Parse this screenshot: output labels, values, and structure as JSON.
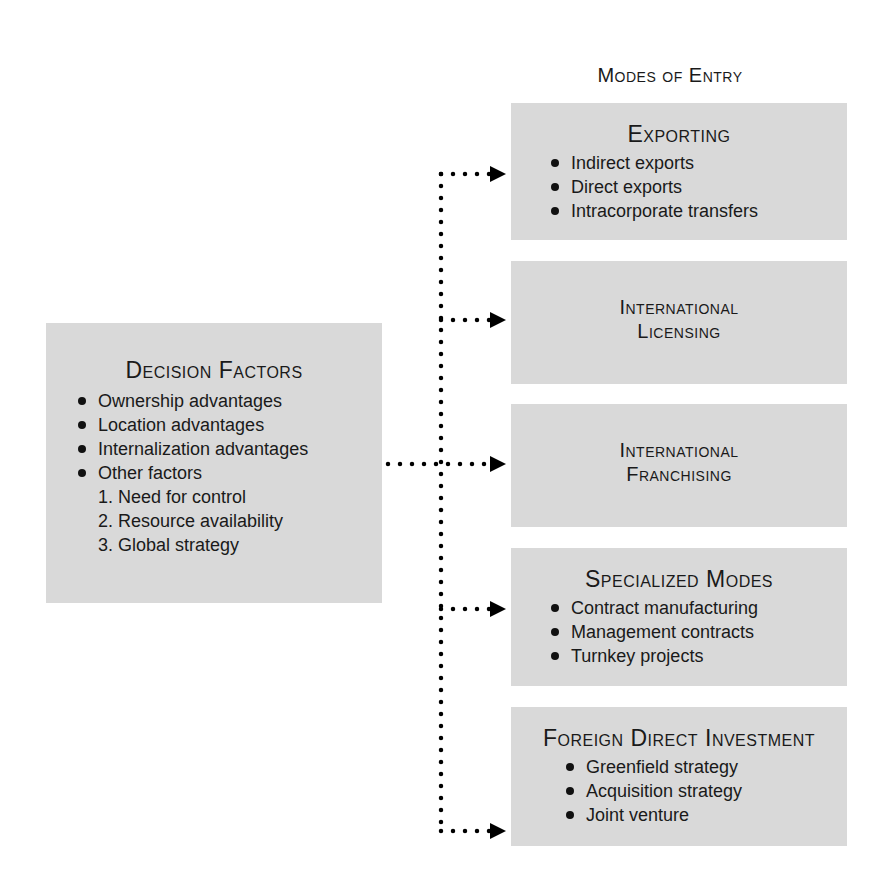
{
  "modes_heading": "Modes of Entry",
  "decision_factors": {
    "title": "Decision Factors",
    "bullets": [
      "Ownership advantages",
      "Location advantages",
      "Internalization advantages",
      "Other factors"
    ],
    "numbered": [
      "1. Need for control",
      "2. Resource availability",
      "3. Global strategy"
    ]
  },
  "modes": [
    {
      "title": "Exporting",
      "items": [
        "Indirect exports",
        "Direct exports",
        "Intracorporate transfers"
      ]
    },
    {
      "title_line1": "International",
      "title_line2": "Licensing"
    },
    {
      "title_line1": "International",
      "title_line2": "Franchising"
    },
    {
      "title": "Specialized Modes",
      "items": [
        "Contract manufacturing",
        "Management contracts",
        "Turnkey projects"
      ]
    },
    {
      "title": "Foreign Direct Investment",
      "items": [
        "Greenfield strategy",
        "Acquisition strategy",
        "Joint venture"
      ]
    }
  ],
  "colors": {
    "box_fill": "#d9d9d9",
    "text": "#1a1a1a",
    "connector": "#000000"
  }
}
